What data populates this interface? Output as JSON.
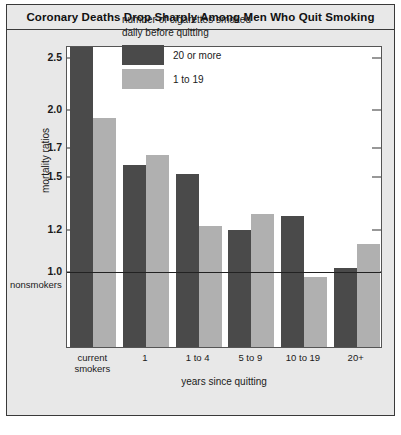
{
  "title": "Coronary Deaths Drop Sharply Among Men Who Quit Smoking",
  "legend": {
    "title": "number of cigarettes smoked\ndaily before quitting",
    "entries": [
      {
        "label": "20 or more",
        "color": "#4a4a4a"
      },
      {
        "label": "1 to 19",
        "color": "#b0b0b0"
      }
    ]
  },
  "annotations": {
    "nonsmokers": "nonsmokers"
  },
  "attribution": "",
  "chart_data": {
    "type": "bar",
    "title": "Coronary Deaths Drop Sharply Among Men Who Quit Smoking",
    "xlabel": "years since quitting",
    "ylabel": "mortality ratios",
    "categories": [
      "current\nsmokers",
      "1",
      "1 to 4",
      "5 to 9",
      "10 to 19",
      "20+"
    ],
    "series": [
      {
        "name": "20 or more",
        "color": "#4a4a4a",
        "values": [
          2.62,
          1.58,
          1.52,
          1.2,
          1.27,
          1.02
        ]
      },
      {
        "name": "1 to 19",
        "color": "#b0b0b0",
        "values": [
          1.93,
          1.65,
          1.22,
          1.28,
          0.98,
          1.13
        ]
      }
    ],
    "yticks": [
      2.5,
      2.0,
      1.7,
      1.5,
      1.2,
      1.0
    ],
    "ytick_labels": [
      "2.5",
      "2.0",
      "1.7",
      "1.5",
      "1.2",
      "1.0"
    ],
    "ylim": [
      0.72,
      2.62
    ],
    "reference_line": {
      "value": 1.0,
      "label": "nonsmokers"
    },
    "grid": false,
    "legend_position": "top-center",
    "scale": "log"
  }
}
